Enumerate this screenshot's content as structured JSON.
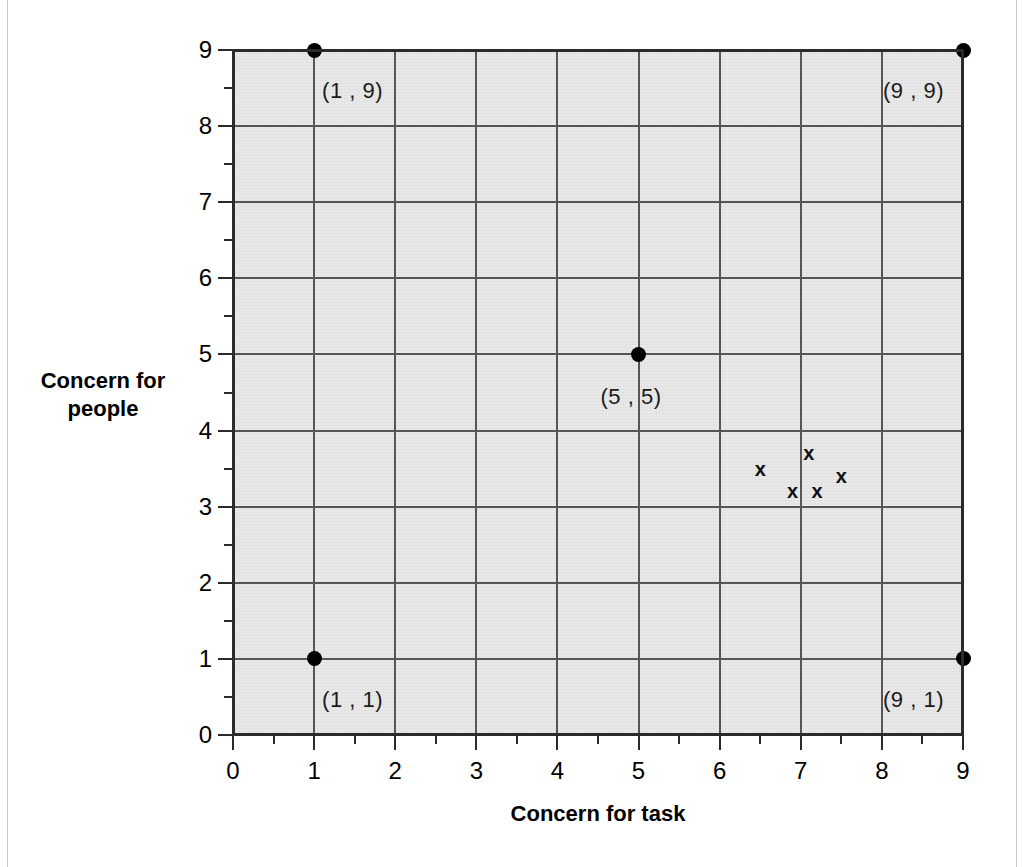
{
  "chart_data": {
    "type": "scatter",
    "title": "",
    "xlabel": "Concern for task",
    "ylabel": "Concern for people",
    "xlim": [
      0,
      9
    ],
    "ylim": [
      0,
      9
    ],
    "x_ticks": [
      "0",
      "1",
      "2",
      "3",
      "4",
      "5",
      "6",
      "7",
      "8",
      "9"
    ],
    "y_ticks": [
      "0",
      "1",
      "2",
      "3",
      "4",
      "5",
      "6",
      "7",
      "8",
      "9"
    ],
    "minor_ticks": "half-unit intervals",
    "grid": true,
    "legend": "none",
    "series": [
      {
        "name": "labelled leadership-style positions",
        "marker": "filled-circle",
        "points": [
          {
            "x": 1,
            "y": 9,
            "label": "(1 , 9)",
            "label_pos": "below-right"
          },
          {
            "x": 9,
            "y": 9,
            "label": "(9 , 9)",
            "label_pos": "below-left"
          },
          {
            "x": 5,
            "y": 5,
            "label": "(5 , 5)",
            "label_pos": "below-center"
          },
          {
            "x": 1,
            "y": 1,
            "label": "(1 , 1)",
            "label_pos": "below-right"
          },
          {
            "x": 9,
            "y": 1,
            "label": "(9 , 1)",
            "label_pos": "below-left"
          }
        ]
      },
      {
        "name": "plotted x observations",
        "marker": "x",
        "points": [
          {
            "x": 6.5,
            "y": 3.5
          },
          {
            "x": 7.1,
            "y": 3.7
          },
          {
            "x": 7.5,
            "y": 3.4
          },
          {
            "x": 6.9,
            "y": 3.2
          },
          {
            "x": 7.2,
            "y": 3.2
          }
        ]
      }
    ]
  },
  "axes": {
    "x_title": "Concern for task",
    "y_title_line1": "Concern for",
    "y_title_line2": "people"
  },
  "colors": {
    "plot_fill": "#e9e9e9",
    "gridline": "#555555",
    "frame": "#2b2b2b",
    "marker": "#000000",
    "page_edge": "#c9c9c9"
  }
}
